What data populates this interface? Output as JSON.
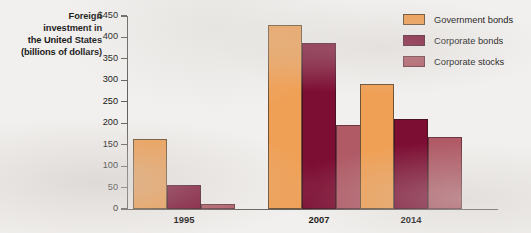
{
  "chart_data": {
    "type": "bar",
    "title": "",
    "xlabel": "",
    "ylabel": "Foreign investment in the United States (billions of dollars)",
    "ylabel_lines": [
      "Foreign",
      "investment in",
      "the United States",
      "(billions of dollars)"
    ],
    "categories": [
      "1995",
      "2007",
      "2014"
    ],
    "series": [
      {
        "name": "Government bonds",
        "color": "#f0a055",
        "values": [
          163,
          429,
          291
        ]
      },
      {
        "name": "Corporate bonds",
        "color": "#7d0e33",
        "values": [
          57,
          387,
          211
        ]
      },
      {
        "name": "Corporate stocks",
        "color": "#b05a66",
        "values": [
          12,
          195,
          169
        ]
      }
    ],
    "ylim": [
      0,
      450
    ],
    "ytick_values": [
      450,
      400,
      350,
      300,
      250,
      200,
      150,
      100,
      50,
      0
    ],
    "ytick_labels": [
      "$450",
      "400",
      "350",
      "300",
      "250",
      "200",
      "150",
      "100",
      "50",
      "0"
    ],
    "grid": false,
    "legend_position": "top-right",
    "legend_entries": [
      "Government bonds",
      "Corporate bonds",
      "Corporate stocks"
    ]
  },
  "legend": {
    "items": [
      {
        "label": "Government bonds"
      },
      {
        "label": "Corporate bonds"
      },
      {
        "label": "Corporate stocks"
      }
    ]
  },
  "axis": {
    "y_title_lines": [
      "Foreign",
      "investment in",
      "the United States",
      "(billions of dollars)"
    ],
    "y_ticks": [
      "$450",
      "400",
      "350",
      "300",
      "250",
      "200",
      "150",
      "100",
      "50",
      "0"
    ],
    "x_ticks": [
      "1995",
      "2007",
      "2014"
    ]
  },
  "colors": {
    "government_bonds": "#f0a055",
    "corporate_bonds": "#7d0e33",
    "corporate_stocks": "#b05a66",
    "axis": "#63605e",
    "background": "#f2f0ee"
  }
}
